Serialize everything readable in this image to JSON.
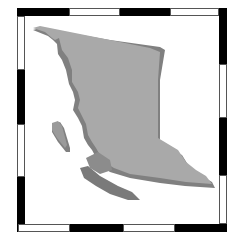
{
  "map": {
    "region": "British Columbia",
    "style": "3D extruded relief silhouette",
    "colors": {
      "landmass": "#a9a9a9",
      "landmass_shadow": "#7f7f7f",
      "highlight_region": "#8c8c8c",
      "frame_dark": "#000000",
      "frame_light": "#ffffff"
    },
    "frame": {
      "type": "alternating black/white neatline border"
    }
  }
}
